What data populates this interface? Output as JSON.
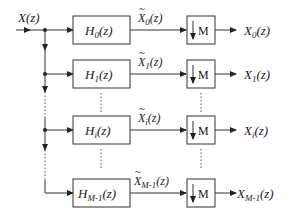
{
  "diagram": {
    "input": {
      "label": "X(z)",
      "base": "X",
      "arg": "(z)"
    },
    "branches": [
      {
        "filter_base": "H",
        "filter_sub": "0",
        "filter_arg": "(z)",
        "mid_base": "X",
        "mid_sub": "0",
        "mid_arg": "(z)",
        "decimator": "M",
        "out_base": "X",
        "out_sub": "0",
        "out_arg": "(z)"
      },
      {
        "filter_base": "H",
        "filter_sub": "1",
        "filter_arg": "(z)",
        "mid_base": "X",
        "mid_sub": "1",
        "mid_arg": "(z)",
        "decimator": "M",
        "out_base": "X",
        "out_sub": "1",
        "out_arg": "(z)"
      },
      {
        "filter_base": "H",
        "filter_sub": "i",
        "filter_arg": "(z)",
        "mid_base": "X",
        "mid_sub": "i",
        "mid_arg": "(z)",
        "decimator": "M",
        "out_base": "X",
        "out_sub": "i",
        "out_arg": "(z)"
      },
      {
        "filter_base": "H",
        "filter_sub": "M-1",
        "filter_arg": "(z)",
        "mid_base": "X",
        "mid_sub": "M-1",
        "mid_arg": "(z)",
        "decimator": "M",
        "out_base": "X",
        "out_sub": "M-1",
        "out_arg": "(z)"
      }
    ],
    "tilde": "~",
    "down_arrow": "↓"
  }
}
